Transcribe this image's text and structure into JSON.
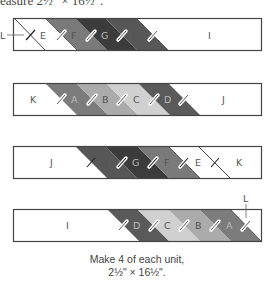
{
  "header": {
    "text": "easure 2½\" × 16½\"."
  },
  "colors": {
    "outline": "#444444",
    "white": "#ffffff",
    "A": "#7c7c7c",
    "B": "#ababab",
    "C": "#d0d0d0",
    "D": "#5a5a5a",
    "F": "#7a7a7a",
    "G": "#3c3c3c",
    "H": "#575757"
  },
  "units": [
    {
      "name": "unit-1",
      "segments": [
        "L",
        "E",
        "F",
        "G",
        "H",
        "I"
      ],
      "labels": [
        "L",
        "E",
        "F",
        "G",
        "H",
        "I"
      ],
      "callout": "L"
    },
    {
      "name": "unit-2",
      "segments": [
        "K",
        "A",
        "B",
        "C",
        "D",
        "J"
      ],
      "labels": [
        "K",
        "A",
        "B",
        "C",
        "D",
        "J"
      ]
    },
    {
      "name": "unit-3",
      "segments": [
        "J",
        "H",
        "G",
        "F",
        "E",
        "L",
        "K"
      ],
      "labels": [
        "J",
        "H",
        "G",
        "F",
        "E",
        "K"
      ]
    },
    {
      "name": "unit-4",
      "segments": [
        "I",
        "D",
        "C",
        "B",
        "A",
        "L"
      ],
      "labels": [
        "I",
        "D",
        "C",
        "B",
        "A",
        "L"
      ],
      "callout": "L"
    }
  ],
  "caption": {
    "line1": "Make 4 of each unit,",
    "line2": "2½\" × 16½\"."
  }
}
